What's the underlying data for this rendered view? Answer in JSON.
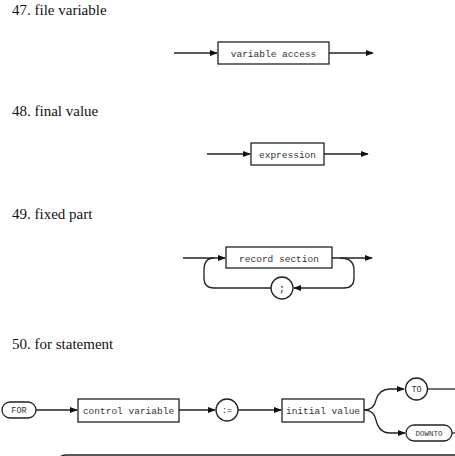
{
  "sections": [
    {
      "heading": "47. file variable",
      "elements": [
        "variable access"
      ]
    },
    {
      "heading": "48. final value",
      "elements": [
        "expression"
      ]
    },
    {
      "heading": "49. fixed part",
      "elements": [
        "record section",
        ";"
      ]
    },
    {
      "heading": "50. for statement",
      "elements": [
        "FOR",
        "control variable",
        ":=",
        "initial value",
        "TO",
        "DOWNTO"
      ]
    }
  ],
  "colors": {
    "stroke": "#222222",
    "background": "#ffffff"
  }
}
